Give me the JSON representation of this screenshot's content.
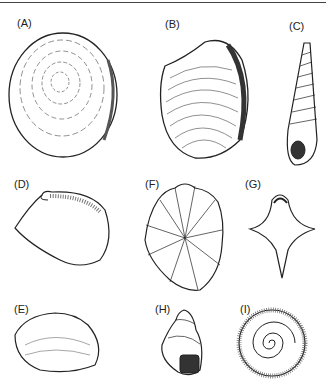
{
  "figure": {
    "panels": [
      {
        "id": "A",
        "label": "(A)",
        "description": "discoidal shell, concentric growth lines"
      },
      {
        "id": "B",
        "label": "(B)",
        "description": "bivalve shell with concentric ribs"
      },
      {
        "id": "C",
        "label": "(C)",
        "description": "tall turreted gastropod shell"
      },
      {
        "id": "D",
        "label": "(D)",
        "description": "stippled bivalve outline"
      },
      {
        "id": "E",
        "label": "(E)",
        "description": "smooth oval bivalve"
      },
      {
        "id": "F",
        "label": "(F)",
        "description": "radially ribbed limpet shell"
      },
      {
        "id": "G",
        "label": "(G)",
        "description": "winged spined shell"
      },
      {
        "id": "H",
        "label": "(H)",
        "description": "small globular gastropod"
      },
      {
        "id": "I",
        "label": "(I)",
        "description": "planispiral coiled shell"
      }
    ],
    "colors": {
      "ink": "#222222",
      "background": "#ffffff"
    }
  }
}
